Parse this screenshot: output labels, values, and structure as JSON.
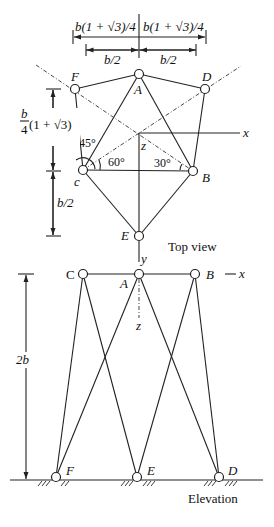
{
  "top_view": {
    "title": "Top view",
    "nodes": {
      "A": "A",
      "B": "B",
      "C": "c",
      "D": "D",
      "E": "E",
      "F": "F"
    },
    "axes": {
      "x": "x",
      "z": "z",
      "y": "y"
    },
    "angles": {
      "a45": "45°",
      "a60": "60°",
      "a30": "30°"
    },
    "dimensions": {
      "top_left": "b(1 + √3)/4",
      "top_right": "b(1 + √3)/4",
      "mid_left": "b/2",
      "mid_right": "b/2",
      "vert_upper_num": "b",
      "vert_upper_den": "4",
      "vert_upper_rest": "(1 + √3)",
      "vert_lower": "b/2"
    }
  },
  "elevation": {
    "title": "Elevation",
    "nodes": {
      "C": "C",
      "A": "A",
      "B": "B",
      "F": "F",
      "E": "E",
      "D": "D"
    },
    "axes": {
      "x": "x",
      "z": "z"
    },
    "height_dim": "2b"
  }
}
